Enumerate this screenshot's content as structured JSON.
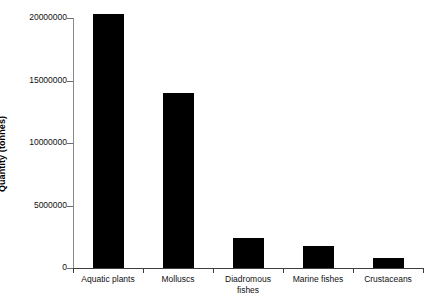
{
  "chart_data": {
    "type": "bar",
    "title": "",
    "xlabel": "",
    "ylabel": "Quantity (tonnes)",
    "categories": [
      "Aquatic plants",
      "Molluscs",
      "Diadromous fishes",
      "Marine fishes",
      "Crustaceans"
    ],
    "category_lines": [
      [
        "Aquatic plants"
      ],
      [
        "Molluscs"
      ],
      [
        "Diadromous",
        "fishes"
      ],
      [
        "Marine fishes"
      ],
      [
        "Crustaceans"
      ]
    ],
    "values": [
      20300000,
      14000000,
      2400000,
      1800000,
      800000
    ],
    "ylim": [
      0,
      20300000
    ],
    "yticks": [
      0,
      5000000,
      10000000,
      15000000,
      20000000
    ],
    "ytick_labels": [
      "0",
      "5000000",
      "10000000",
      "15000000",
      "20000000"
    ],
    "grid": false,
    "legend": false,
    "bar_color": "#000000",
    "axis_color": "#3d3d3d",
    "background_color": "#ffffff"
  }
}
